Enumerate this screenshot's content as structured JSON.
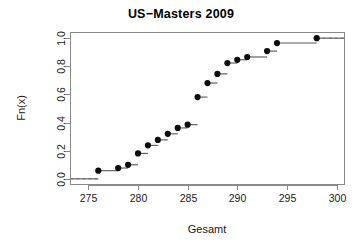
{
  "chart_data": {
    "type": "line",
    "subtype": "ecdf-step",
    "title": "US−Masters 2009",
    "xlabel": "Gesamt",
    "ylabel": "Fn(x)",
    "xlim": [
      273.2,
      300.8
    ],
    "ylim": [
      -0.04,
      1.04
    ],
    "xticks": [
      275,
      280,
      285,
      290,
      295,
      300
    ],
    "xtick_labels": [
      "275",
      "280",
      "285",
      "290",
      "295",
      "300"
    ],
    "yticks": [
      0.0,
      0.2,
      0.4,
      0.6,
      0.8,
      1.0
    ],
    "ytick_labels": [
      "0.0",
      "0.2",
      "0.4",
      "0.6",
      "0.8",
      "1.0"
    ],
    "grid": false,
    "legend": null,
    "n_observations": 26,
    "marker": "filled-circle",
    "reference_lines": [
      {
        "y": 0.0,
        "style": "dashed",
        "from_x": 273.2,
        "to_x": 276.0
      },
      {
        "y": 1.0,
        "style": "dashed",
        "from_x": 298.0,
        "to_x": 300.8
      }
    ],
    "x": [
      276,
      278,
      279,
      280,
      281,
      282,
      283,
      284,
      285,
      286,
      287,
      288,
      289,
      290,
      291,
      293,
      294,
      298
    ],
    "y": [
      0.058,
      0.077,
      0.1,
      0.181,
      0.238,
      0.277,
      0.32,
      0.362,
      0.385,
      0.581,
      0.681,
      0.746,
      0.823,
      0.846,
      0.866,
      0.908,
      0.965,
      1.0
    ],
    "points": [
      {
        "x": 276,
        "Fn": 0.058
      },
      {
        "x": 278,
        "Fn": 0.077
      },
      {
        "x": 279,
        "Fn": 0.1
      },
      {
        "x": 280,
        "Fn": 0.181
      },
      {
        "x": 281,
        "Fn": 0.238
      },
      {
        "x": 282,
        "Fn": 0.277
      },
      {
        "x": 283,
        "Fn": 0.32
      },
      {
        "x": 284,
        "Fn": 0.362
      },
      {
        "x": 285,
        "Fn": 0.385
      },
      {
        "x": 286,
        "Fn": 0.581
      },
      {
        "x": 287,
        "Fn": 0.681
      },
      {
        "x": 288,
        "Fn": 0.746
      },
      {
        "x": 289,
        "Fn": 0.823
      },
      {
        "x": 290,
        "Fn": 0.846
      },
      {
        "x": 291,
        "Fn": 0.866
      },
      {
        "x": 293,
        "Fn": 0.908
      },
      {
        "x": 294,
        "Fn": 0.965
      },
      {
        "x": 298,
        "Fn": 1.0
      }
    ],
    "colors": {
      "point": "#0d0d0d",
      "step": "#555555",
      "axis": "#8a8a8a",
      "reference": "#9a9a9a",
      "text": "#1a1a1a",
      "background": "#ffffff"
    }
  }
}
